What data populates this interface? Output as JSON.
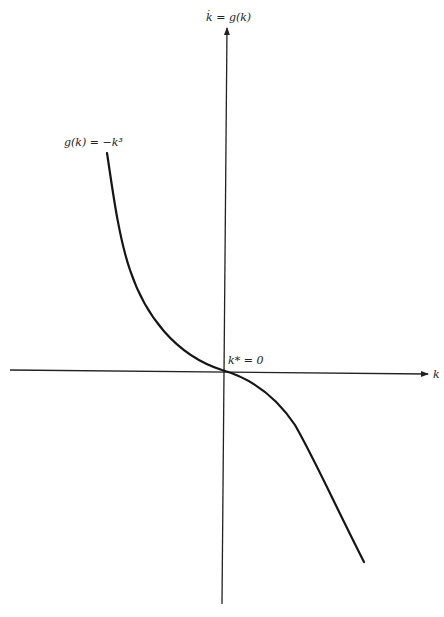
{
  "diagram": {
    "type": "phase-diagram",
    "y_axis_label": "k̇ = g(k)",
    "x_axis_label": "k",
    "curve_label": "g(k) = −k³",
    "equilibrium_label": "k* = 0",
    "colors": {
      "background": "#ffffff",
      "line": "#151515"
    }
  }
}
